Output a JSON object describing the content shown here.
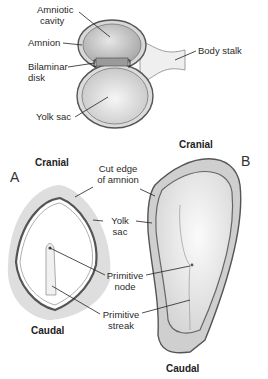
{
  "diagram": {
    "top": {
      "labels": {
        "amniotic_cavity": "Amniotic\ncavity",
        "amniotic_cavity_l1": "Amniotic",
        "amniotic_cavity_l2": "cavity",
        "amnion": "Amnion",
        "bilaminar_l1": "Bilaminar",
        "bilaminar_l2": "disk",
        "yolk_sac": "Yolk sac",
        "body_stalk": "Body stalk"
      }
    },
    "panel_a": {
      "letter": "A",
      "cranial": "Cranial",
      "caudal": "Caudal"
    },
    "panel_b": {
      "letter": "B",
      "cranial": "Cranial",
      "caudal": "Caudal"
    },
    "shared_labels": {
      "cut_edge_l1": "Cut edge",
      "cut_edge_l2": "of amnion",
      "yolk_l1": "Yolk",
      "yolk_l2": "sac",
      "node_l1": "Primitive",
      "node_l2": "node",
      "streak_l1": "Primitive",
      "streak_l2": "streak"
    },
    "colors": {
      "outline": "#5a5a5a",
      "fill_dark": "#b8b8b8",
      "fill_light": "#e8e8e8",
      "halo": "#d9d9d9"
    }
  }
}
